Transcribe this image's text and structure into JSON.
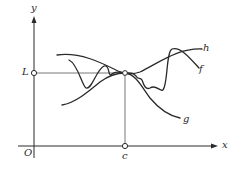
{
  "figure": {
    "colors": {
      "stroke": "#2a2a2a",
      "background": "#ffffff"
    },
    "axes": {
      "x_label": "x",
      "y_label": "y",
      "origin_label": "O"
    },
    "markers": {
      "limit_label": "L",
      "point_label": "c"
    },
    "curves": [
      {
        "name": "h",
        "label": "h",
        "role": "upper bound"
      },
      {
        "name": "f",
        "label": "f",
        "role": "squeezed function"
      },
      {
        "name": "g",
        "label": "g",
        "role": "lower bound"
      }
    ]
  }
}
